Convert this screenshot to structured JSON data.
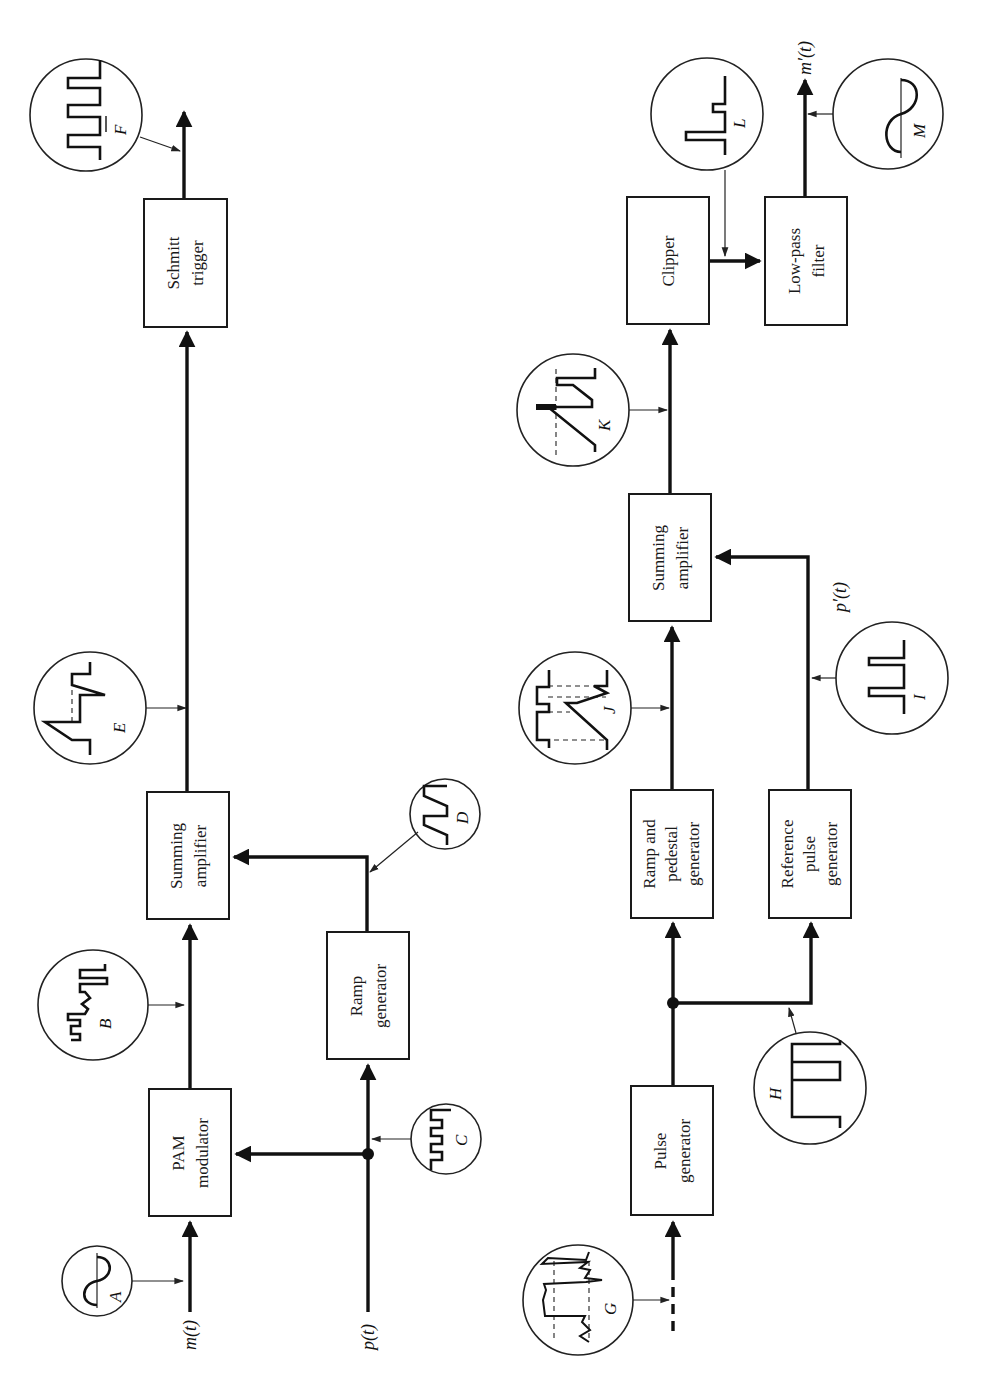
{
  "figure": {
    "orientation": "rotated-90-ccw",
    "description_rows": [
      "transmitter",
      "receiver"
    ]
  },
  "transmitter": {
    "blocks": [
      {
        "id": "pam",
        "line1": "PAM",
        "line2": "modulator",
        "x": 149,
        "y": 1090,
        "w": 82,
        "h": 127
      },
      {
        "id": "sum1",
        "line1": "Summing",
        "line2": "amplifier",
        "x": 147,
        "y": 793,
        "w": 82,
        "h": 127
      },
      {
        "id": "schmitt",
        "line1": "Schmitt",
        "line2": "trigger",
        "x": 143,
        "y": 199,
        "w": 83,
        "h": 128
      },
      {
        "id": "ramp",
        "line1": "Ramp",
        "line2": "generator",
        "x": 327,
        "y": 933,
        "w": 82,
        "h": 127
      }
    ],
    "signals": {
      "input_message": "m(t)",
      "input_pulse": "p(t)"
    },
    "waveform_labels": {
      "A": "A",
      "B": "B",
      "C": "C",
      "D": "D",
      "E": "E",
      "F": "F"
    }
  },
  "receiver": {
    "blocks": [
      {
        "id": "pulsegen",
        "line1": "Pulse",
        "line2": "generator",
        "line3": "",
        "x": 631,
        "y": 1087,
        "w": 82,
        "h": 129
      },
      {
        "id": "ramp_ped",
        "line1": "Ramp and",
        "line2": "pedestal",
        "line3": "generator",
        "x": 631,
        "y": 790,
        "w": 82,
        "h": 128
      },
      {
        "id": "refpulse",
        "line1": "Reference",
        "line2": "pulse",
        "line3": "generator",
        "x": 769,
        "y": 790,
        "w": 82,
        "h": 128
      },
      {
        "id": "sum2",
        "line1": "Summing",
        "line2": "amplifier",
        "line3": "",
        "x": 629,
        "y": 495,
        "w": 82,
        "h": 127
      },
      {
        "id": "clipper",
        "line1": "Clipper",
        "line2": "",
        "line3": "",
        "x": 627,
        "y": 198,
        "w": 82,
        "h": 127
      },
      {
        "id": "lpf",
        "line1": "Low-pass",
        "line2": "filter",
        "line3": "",
        "x": 765,
        "y": 197,
        "w": 82,
        "h": 128
      }
    ],
    "signals": {
      "reference_pulse": "p′(t)",
      "output_message": "m′(t)"
    },
    "waveform_labels": {
      "G": "G",
      "H": "H",
      "I": "I",
      "J": "J",
      "K": "K",
      "L": "L",
      "M": "M"
    }
  },
  "colors": {
    "ink": "#111111",
    "paper": "#ffffff"
  }
}
